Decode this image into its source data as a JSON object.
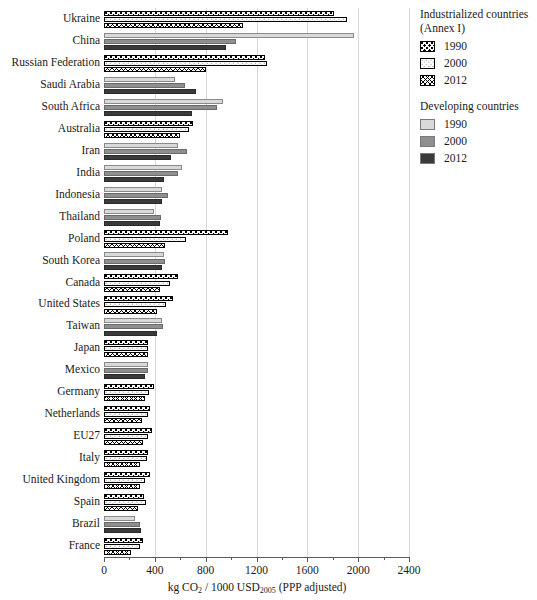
{
  "chart_data": {
    "type": "bar",
    "orientation": "horizontal",
    "title": "",
    "xlabel": "kg CO2 / 1000 USD2005 (PPP adjusted)",
    "xlabel_parts": {
      "pre": "kg CO",
      "sub1": "2",
      "mid": " / 1000 USD",
      "sub2": "2005",
      "post": " (PPP adjusted)"
    },
    "ylabel": "",
    "xlim": [
      0,
      2400
    ],
    "xticks": [
      0,
      400,
      800,
      1200,
      1600,
      2000,
      2400
    ],
    "xticklabels": [
      "0",
      "400",
      "800",
      "1200",
      "1600",
      "2000",
      "2400"
    ],
    "xminorticks": [
      200,
      600,
      1000,
      1400,
      1800,
      2200
    ],
    "grid": "vertical",
    "legend_position": "right",
    "categories": [
      "Ukraine",
      "China",
      "Russian Federation",
      "Saudi Arabia",
      "South Africa",
      "Australia",
      "Iran",
      "India",
      "Indonesia",
      "Thailand",
      "Poland",
      "South Korea",
      "Canada",
      "United States",
      "Taiwan",
      "Japan",
      "Mexico",
      "Germany",
      "Netherlands",
      "EU27",
      "Italy",
      "United Kingdom",
      "Spain",
      "Brazil",
      "France"
    ],
    "group_of_category": [
      "industrialized",
      "developing",
      "industrialized",
      "developing",
      "developing",
      "industrialized",
      "developing",
      "developing",
      "developing",
      "developing",
      "industrialized",
      "developing",
      "industrialized",
      "industrialized",
      "developing",
      "industrialized",
      "developing",
      "industrialized",
      "industrialized",
      "industrialized",
      "industrialized",
      "industrialized",
      "industrialized",
      "developing",
      "industrialized"
    ],
    "series": [
      {
        "name": "1990",
        "values": [
          1810,
          1970,
          1270,
          560,
          935,
          700,
          580,
          615,
          455,
          395,
          975,
          470,
          580,
          540,
          460,
          350,
          350,
          395,
          365,
          375,
          345,
          360,
          315,
          245,
          310
        ]
      },
      {
        "name": "2000",
        "values": [
          1910,
          1040,
          1285,
          635,
          890,
          665,
          650,
          580,
          505,
          450,
          645,
          480,
          520,
          490,
          465,
          350,
          345,
          355,
          345,
          350,
          335,
          325,
          330,
          280,
          280
        ]
      },
      {
        "name": "2012",
        "values": [
          1090,
          960,
          805,
          720,
          693,
          600,
          530,
          475,
          460,
          440,
          480,
          455,
          440,
          420,
          415,
          345,
          325,
          320,
          300,
          310,
          280,
          280,
          265,
          295,
          215
        ]
      }
    ]
  },
  "legend": {
    "groups": [
      {
        "title_line1": "Industrialized countries",
        "title_line2": "(Annex I)",
        "entries": [
          {
            "label": "1990",
            "pattern": "dots-large-black"
          },
          {
            "label": "2000",
            "pattern": "dots-small-grey"
          },
          {
            "label": "2012",
            "pattern": "crosshatch-diagonal"
          }
        ]
      },
      {
        "title_line1": "Developing countries",
        "title_line2": "",
        "entries": [
          {
            "label": "1990",
            "color": "#d9d9d9"
          },
          {
            "label": "2000",
            "color": "#8f8f8f"
          },
          {
            "label": "2012",
            "color": "#3a3a3a"
          }
        ]
      }
    ]
  },
  "colors": {
    "dev_1990": "#d9d9d9",
    "dev_2000": "#8f8f8f",
    "dev_2012": "#3a3a3a",
    "grid": "#d8d8d8",
    "axis": "#5a5a5a",
    "text": "#1a1a1a"
  }
}
